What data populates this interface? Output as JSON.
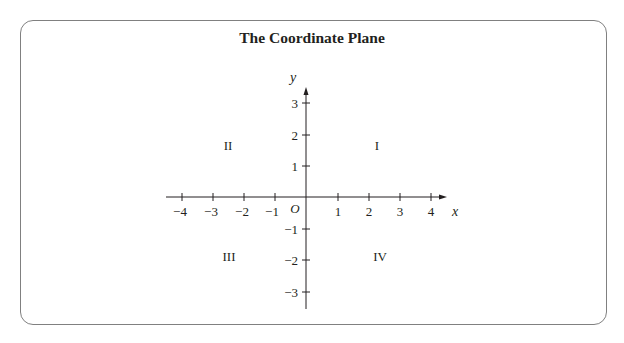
{
  "figure": {
    "title": "The Coordinate Plane",
    "x_axis_label": "x",
    "y_axis_label": "y",
    "origin_label": "O",
    "x_ticks": [
      {
        "value": -4,
        "label": "−4"
      },
      {
        "value": -3,
        "label": "−3"
      },
      {
        "value": -2,
        "label": "−2"
      },
      {
        "value": -1,
        "label": "−1"
      },
      {
        "value": 1,
        "label": "1"
      },
      {
        "value": 2,
        "label": "2"
      },
      {
        "value": 3,
        "label": "3"
      },
      {
        "value": 4,
        "label": "4"
      }
    ],
    "y_ticks": [
      {
        "value": 3,
        "label": "3"
      },
      {
        "value": 2,
        "label": "2"
      },
      {
        "value": 1,
        "label": "1"
      },
      {
        "value": -1,
        "label": "−1"
      },
      {
        "value": -2,
        "label": "−2"
      },
      {
        "value": -3,
        "label": "−3"
      }
    ],
    "quadrants": {
      "I": "I",
      "II": "II",
      "III": "III",
      "IV": "IV"
    },
    "x_range": [
      -4.5,
      4.5
    ],
    "y_range": [
      -3.5,
      3.5
    ],
    "colors": {
      "ink": "#231f20",
      "frame": "#808080"
    }
  }
}
